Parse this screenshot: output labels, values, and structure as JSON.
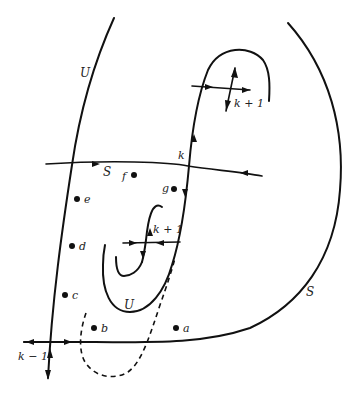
{
  "diagram": {
    "labels": {
      "U_top": "U",
      "S_mid": "S",
      "S_right": "S",
      "U_bottom": "U",
      "k": "k",
      "k_plus_1_upper": "k + 1",
      "k_plus_1_middle": "k + 1",
      "k_minus_1": "k − 1"
    },
    "points": [
      {
        "name": "a",
        "label": "a"
      },
      {
        "name": "b",
        "label": "b"
      },
      {
        "name": "c",
        "label": "c"
      },
      {
        "name": "d",
        "label": "d"
      },
      {
        "name": "e",
        "label": "e"
      },
      {
        "name": "f",
        "label": "f"
      },
      {
        "name": "g",
        "label": "g"
      }
    ],
    "colors": {
      "stroke": "#111111",
      "background": "#ffffff"
    }
  }
}
